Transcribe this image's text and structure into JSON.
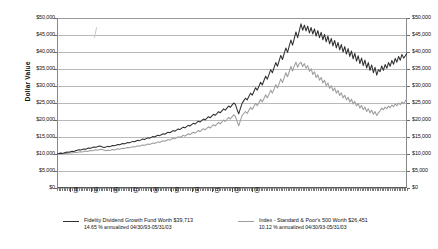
{
  "chart_data": {
    "type": "line",
    "title": "",
    "xlabel": "",
    "ylabel": "Dollar Value",
    "ylim": [
      0,
      50000
    ],
    "ytick_labels": [
      "$50,000",
      "$45,000",
      "$40,000",
      "$35,000",
      "$30,000",
      "$25,000",
      "$20,000",
      "$15,000",
      "$10,000",
      "$5,000",
      "$0"
    ],
    "ytick_values": [
      50000,
      45000,
      40000,
      35000,
      30000,
      25000,
      20000,
      15000,
      10000,
      5000,
      0
    ],
    "xtick_labels": [
      "94",
      "95",
      "96",
      "97",
      "98",
      "99",
      "00",
      "01",
      "02",
      "03"
    ],
    "grid": true,
    "legend_position": "bottom",
    "axis_right_mirrored": true,
    "x_range": [
      "04/30/93",
      "05/31/03"
    ],
    "series": [
      {
        "name": "Fidelity Dividend Growth Fund",
        "color": "#2f2f2f",
        "final_value": 39713,
        "annualized_return": "14.65 %",
        "values": [
          10000,
          10120,
          10260,
          10180,
          10310,
          10450,
          10600,
          10520,
          10680,
          10830,
          10760,
          10920,
          11080,
          11240,
          11150,
          11320,
          11500,
          11420,
          11600,
          11780,
          11700,
          11880,
          12070,
          11980,
          12160,
          12360,
          12270,
          12080,
          11900,
          12060,
          12240,
          12130,
          12310,
          12500,
          12400,
          12580,
          12780,
          12690,
          12880,
          13080,
          12980,
          13180,
          13390,
          13280,
          13490,
          13710,
          13600,
          13820,
          14050,
          13930,
          14160,
          14400,
          14280,
          14520,
          14770,
          14640,
          14890,
          15150,
          15010,
          15280,
          15550,
          15400,
          15680,
          15970,
          15810,
          16110,
          16420,
          16250,
          16560,
          16880,
          16700,
          17030,
          17370,
          17180,
          17530,
          17890,
          17690,
          18060,
          18440,
          18230,
          18620,
          19020,
          18800,
          19210,
          19640,
          19400,
          19830,
          20280,
          20020,
          20480,
          20960,
          20680,
          21170,
          21680,
          21380,
          21900,
          22440,
          22120,
          22680,
          23260,
          22910,
          23500,
          24110,
          23730,
          24360,
          25010,
          24600,
          23100,
          21800,
          23400,
          24900,
          25700,
          26400,
          25900,
          26900,
          27900,
          27300,
          28400,
          29500,
          28800,
          29900,
          31100,
          30300,
          31600,
          32900,
          32000,
          33400,
          34800,
          33900,
          35400,
          36900,
          35800,
          37400,
          39000,
          37800,
          39500,
          41200,
          39900,
          41700,
          43500,
          42000,
          43900,
          45900,
          44200,
          46200,
          48300,
          46400,
          47900,
          46200,
          47600,
          45600,
          47200,
          45300,
          46800,
          44700,
          46300,
          44200,
          45800,
          43600,
          45200,
          43000,
          44700,
          42400,
          44000,
          41800,
          43400,
          41200,
          42800,
          40600,
          42200,
          40000,
          41600,
          39400,
          41000,
          38700,
          40300,
          38000,
          39600,
          37300,
          38900,
          36600,
          38200,
          36000,
          37600,
          35300,
          36900,
          34600,
          36200,
          33900,
          35500,
          33200,
          34800,
          34200,
          35900,
          34600,
          36300,
          35200,
          36900,
          35800,
          37500,
          36400,
          38100,
          37000,
          38700,
          37600,
          39300,
          38200,
          38900,
          39713
        ]
      },
      {
        "name": "Index - Standard & Poor's 500",
        "color": "#9d9d9d",
        "final_value": 26451,
        "annualized_return": "10.12 %",
        "values": [
          10000,
          10050,
          10130,
          10060,
          10150,
          10250,
          10180,
          10280,
          10390,
          10300,
          10410,
          10530,
          10440,
          10560,
          10690,
          10590,
          10720,
          10860,
          10760,
          10890,
          11030,
          10930,
          11070,
          11220,
          11110,
          11250,
          11410,
          11290,
          11130,
          10980,
          11120,
          11020,
          11160,
          11310,
          11210,
          11360,
          11520,
          11410,
          11560,
          11720,
          11610,
          11770,
          11940,
          11820,
          11990,
          12170,
          12050,
          12230,
          12420,
          12290,
          12480,
          12680,
          12550,
          12750,
          12960,
          12820,
          13030,
          13250,
          13100,
          13330,
          13570,
          13410,
          13650,
          13900,
          13730,
          13990,
          14260,
          14080,
          14360,
          14650,
          14450,
          14750,
          15060,
          14840,
          15160,
          15490,
          15250,
          15590,
          15940,
          15680,
          16040,
          16410,
          16120,
          16510,
          16910,
          16600,
          17010,
          17440,
          17100,
          17540,
          18000,
          17640,
          18120,
          18620,
          18240,
          18760,
          19290,
          18870,
          19420,
          20000,
          19560,
          20150,
          20760,
          20280,
          20910,
          21560,
          21040,
          19600,
          18300,
          19900,
          21300,
          21900,
          22500,
          21900,
          22800,
          23700,
          23100,
          24000,
          24900,
          24200,
          25100,
          26100,
          25300,
          26300,
          27400,
          26500,
          27600,
          28800,
          27900,
          29100,
          30400,
          29400,
          30700,
          32100,
          31000,
          32400,
          33900,
          32700,
          34200,
          35800,
          34400,
          35900,
          37000,
          35500,
          36600,
          37000,
          35700,
          36600,
          35200,
          36000,
          34300,
          35100,
          33400,
          34200,
          32500,
          33300,
          31700,
          32500,
          30900,
          31700,
          30100,
          30900,
          29300,
          30100,
          28600,
          29400,
          27900,
          28700,
          27200,
          28000,
          26500,
          27300,
          25900,
          26700,
          25300,
          26100,
          24700,
          25500,
          24100,
          24900,
          23500,
          24300,
          23000,
          23800,
          22500,
          23300,
          22100,
          22900,
          21700,
          22500,
          21300,
          22100,
          22700,
          23500,
          23000,
          23800,
          23300,
          24100,
          23600,
          24400,
          23900,
          24700,
          24200,
          25000,
          24500,
          25300,
          24800,
          25600,
          26451
        ]
      }
    ]
  },
  "legend": [
    {
      "line1": "Fidelity Dividend Growth Fund Worth $39,713",
      "line2": "14.65 % annualized 04/30/93-05/31/03"
    },
    {
      "line1": "Index - Standard & Poor's 500 Worth $26,451",
      "line2": "10.12 % annualized 04/30/93-05/31/03"
    }
  ]
}
